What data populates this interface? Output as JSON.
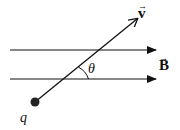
{
  "diagram": {
    "type": "physics-vector-diagram",
    "labels": {
      "velocity": "v",
      "field": "B",
      "angle": "θ",
      "charge": "q"
    },
    "colors": {
      "stroke": "#111111",
      "background": "#ffffff"
    },
    "field_lines": [
      {
        "y": 50,
        "x_start": 10,
        "x_end": 156
      },
      {
        "y": 79,
        "x_start": 10,
        "x_end": 156
      }
    ],
    "velocity_vector": {
      "x1": 35,
      "y1": 102,
      "x2": 137,
      "y2": 19
    },
    "charge_position": {
      "x": 35,
      "y": 102
    }
  }
}
